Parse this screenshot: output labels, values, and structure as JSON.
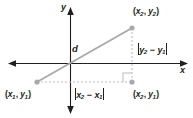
{
  "figure": {
    "name": "distance-formula-diagram",
    "background_color": "#ffffff"
  },
  "axes": {
    "x_label": "x",
    "y_label": "y",
    "color": "#231f20",
    "x_axis": {
      "y": 63,
      "x_start": 9,
      "x_end": 187
    },
    "y_axis": {
      "x": 70,
      "y_start": 8,
      "y_end": 113
    }
  },
  "segments": {
    "hypotenuse_color": "#a7a9ac",
    "leg_color": "#bcbec0",
    "point_color": "#a7a9ac"
  },
  "labels": {
    "distance": "d",
    "point1": {
      "open": "(",
      "x": "x",
      "xsub": "1",
      "comma": ", ",
      "y": "y",
      "ysub": "1",
      "close": ")"
    },
    "point2": {
      "open": "(",
      "x": "x",
      "xsub": "2",
      "comma": ", ",
      "y": "y",
      "ysub": "2",
      "close": ")"
    },
    "point3": {
      "open": "(",
      "x": "x",
      "xsub": "2",
      "comma": ", ",
      "y": "y",
      "ysub": "1",
      "close": ")"
    },
    "horizontal_leg": {
      "v1": "x",
      "s1": "2",
      "op": " − ",
      "v2": "x",
      "s2": "1"
    },
    "vertical_leg": {
      "v1": "y",
      "s1": "2",
      "op": " − ",
      "v2": "y",
      "s2": "1"
    }
  },
  "points": {
    "p1": {
      "px": 37,
      "py": 82
    },
    "p2": {
      "px": 132,
      "py": 28
    },
    "p3": {
      "px": 132,
      "py": 82
    }
  }
}
